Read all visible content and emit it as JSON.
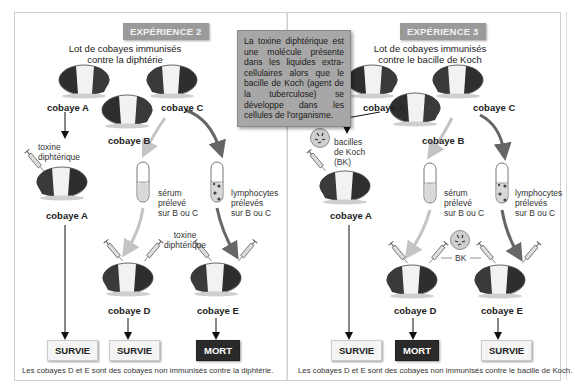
{
  "info_box": {
    "text": "La toxine diphtérique est une molécule présente dans les liquides extra-cellulaires alors que le bacille de Koch (agent de la tuberculose) se développe dans les cellules de l'organisme."
  },
  "experiment2": {
    "badge": "EXPÉRIENCE 2",
    "caption_line1": "Lot de cobayes immunisés",
    "caption_line2": "contre la diphtérie",
    "labels": {
      "a_top": "cobaye A",
      "b": "cobaye B",
      "c": "cobaye C",
      "a_bottom": "cobaye A",
      "d": "cobaye D",
      "e": "cobaye E"
    },
    "injection_a": [
      "toxine",
      "diphtérique"
    ],
    "serum": [
      "sérum",
      "prélevé",
      "sur B ou C"
    ],
    "lymphocytes": [
      "lymphocytes",
      "prélevés",
      "sur B ou C"
    ],
    "injection_de": [
      "toxine",
      "diphtérique"
    ],
    "results": [
      "SURVIE",
      "SURVIE",
      "MORT"
    ],
    "note": "Les cobayes D et E sont des cobayes non immunisés contre la diphtérie."
  },
  "experiment3": {
    "badge": "EXPÉRIENCE 3",
    "caption_line1": "Lot de cobayes immunisés",
    "caption_line2": "contre le bacille de Koch",
    "labels": {
      "a_top": "cobaye A",
      "b": "cobaye B",
      "c": "cobaye C",
      "a_bottom": "cobaye A",
      "d": "cobaye D",
      "e": "cobaye E"
    },
    "injection_a": [
      "bacilles",
      "de Koch",
      "(BK)"
    ],
    "serum": [
      "sérum",
      "prélevé",
      "sur B ou C"
    ],
    "lymphocytes": [
      "lymphocytes",
      "prélevés",
      "sur B ou C"
    ],
    "injection_de": "BK",
    "results": [
      "SURVIE",
      "MORT",
      "SURVIE"
    ],
    "note": "Les cobayes D et E sont des cobayes non immunisés contre le bacille de Koch."
  },
  "colors": {
    "badge_bg": "#9a9a9a",
    "info_bg": "#a7a7a7",
    "mort_bg": "#2a2a2a",
    "survie_bg": "#f4f4f4",
    "arrow_light": "#bfbfbf",
    "arrow_dark": "#6a6a6a"
  }
}
